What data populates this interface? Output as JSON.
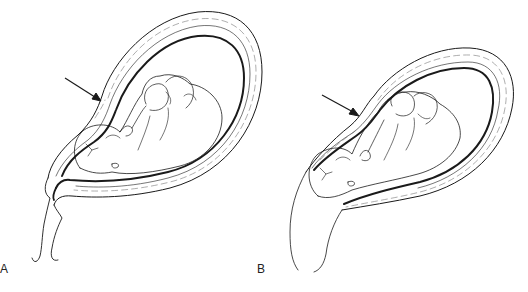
{
  "figure": {
    "panels": [
      {
        "label": "A",
        "description": "Fetus in utero, cephalic presentation, cervix closed; arrow indicates uterine wall",
        "arrow": {
          "from": [
            65,
            78
          ],
          "to": [
            100,
            100
          ]
        },
        "label_position": [
          0,
          263
        ]
      },
      {
        "label": "B",
        "description": "Fetus in utero, cephalic presentation, lower uterine segment thinned/cervix effaced; arrow indicates uterine wall",
        "arrow": {
          "from": [
            322,
            95
          ],
          "to": [
            358,
            115
          ]
        },
        "label_position": [
          257,
          263
        ]
      }
    ],
    "caption": {
      "visible": false,
      "note": "caption text clipped at bottom edge, not legible"
    },
    "colors": {
      "line": "#1a1a1a",
      "wall_hatch": "#777777",
      "background": "#ffffff"
    }
  }
}
